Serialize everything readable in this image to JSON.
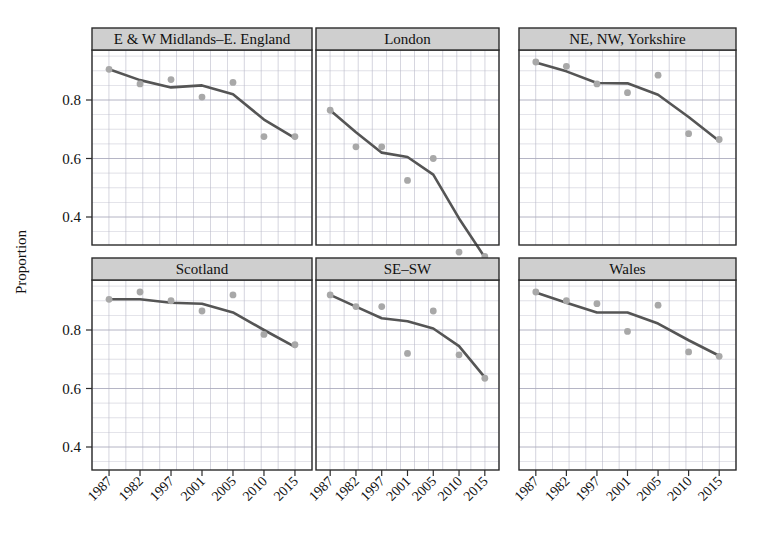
{
  "figure": {
    "axis_title_y": "Proportion",
    "y_ticks": [
      "0.4",
      "0.6",
      "0.8"
    ],
    "x_ticks": [
      "1987",
      "1982",
      "1997",
      "2001",
      "2005",
      "2010",
      "2015"
    ],
    "strip_fill": "#cfcfcf",
    "strip_border": "#2b2b2b",
    "panel_border": "#2b2b2b",
    "grid_color": "#b9b9c8",
    "line_color": "#555555",
    "point_color": "#a8a8a8"
  },
  "chart_data": {
    "type": "line",
    "title": "",
    "subtitle": "",
    "xlabel": "",
    "ylabel": "Proportion",
    "x": [
      1987,
      1982,
      1997,
      2001,
      2005,
      2010,
      2015
    ],
    "x_tick_labels": [
      "1987",
      "1982",
      "1997",
      "2001",
      "2005",
      "2010",
      "2015"
    ],
    "ytick_values": [
      0.4,
      0.6,
      0.8
    ],
    "ylim": [
      0.24,
      0.95
    ],
    "xlim_index": [
      0,
      6
    ],
    "grid": true,
    "legend": "none",
    "facet_layout": {
      "rows": 2,
      "cols": 3
    },
    "panels": [
      {
        "name": "E & W Midlands–E. England",
        "row": 0,
        "col": 0,
        "points": [
          0.905,
          0.855,
          0.87,
          0.81,
          0.86,
          0.675,
          0.675
        ],
        "fit": [
          0.905,
          0.868,
          0.843,
          0.85,
          0.82,
          0.733,
          0.67
        ]
      },
      {
        "name": "London",
        "row": 0,
        "col": 1,
        "points": [
          0.765,
          0.64,
          0.64,
          0.525,
          0.6,
          0.28,
          0.265
        ],
        "fit": [
          0.765,
          0.69,
          0.62,
          0.605,
          0.545,
          0.395,
          0.262
        ]
      },
      {
        "name": "NE, NW, Yorkshire",
        "row": 0,
        "col": 2,
        "points": [
          0.93,
          0.915,
          0.855,
          0.825,
          0.885,
          0.685,
          0.665
        ],
        "fit": [
          0.928,
          0.898,
          0.858,
          0.857,
          0.818,
          0.742,
          0.66
        ]
      },
      {
        "name": "Scotland",
        "row": 1,
        "col": 0,
        "points": [
          0.905,
          0.93,
          0.9,
          0.865,
          0.92,
          0.785,
          0.75
        ],
        "fit": [
          0.905,
          0.905,
          0.893,
          0.89,
          0.86,
          0.8,
          0.742
        ]
      },
      {
        "name": "SE–SW",
        "row": 1,
        "col": 1,
        "points": [
          0.92,
          0.88,
          0.88,
          0.72,
          0.865,
          0.715,
          0.635
        ],
        "fit": [
          0.92,
          0.88,
          0.84,
          0.83,
          0.805,
          0.745,
          0.638
        ]
      },
      {
        "name": "Wales",
        "row": 1,
        "col": 2,
        "points": [
          0.93,
          0.9,
          0.89,
          0.795,
          0.885,
          0.725,
          0.71
        ],
        "fit": [
          0.928,
          0.893,
          0.86,
          0.86,
          0.822,
          0.765,
          0.712
        ]
      }
    ]
  }
}
